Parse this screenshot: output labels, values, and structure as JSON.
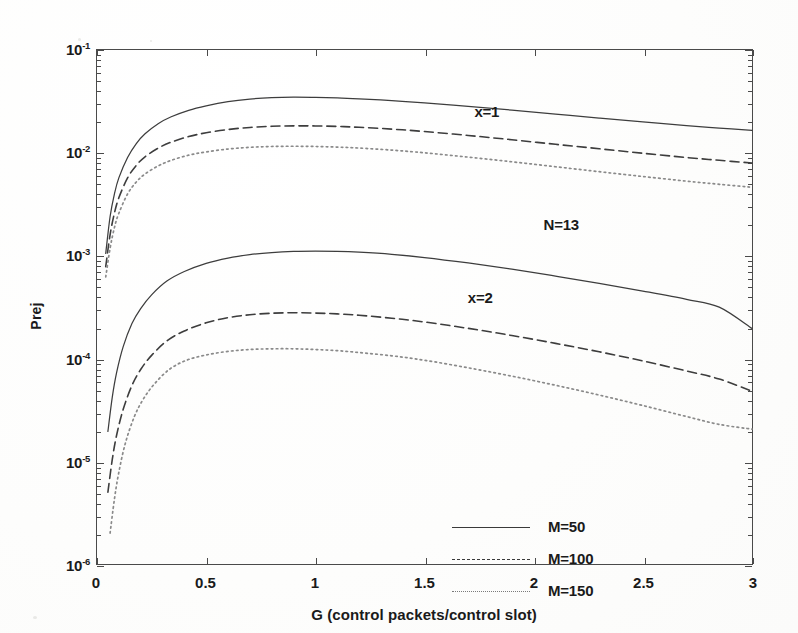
{
  "chart_data": {
    "type": "line",
    "title": "",
    "xlabel": "G (control packets/control slot)",
    "ylabel": "Prej",
    "xscale": "linear",
    "yscale": "log",
    "xlim": [
      0,
      3
    ],
    "ylim": [
      1e-06,
      0.1
    ],
    "grid": false,
    "xticks": [
      "0",
      "0.5",
      "1",
      "1.5",
      "2",
      "2.5",
      "3"
    ],
    "xtick_values": [
      0,
      0.5,
      1,
      1.5,
      2,
      2.5,
      3
    ],
    "ytick_labels": [
      "10-1",
      "10-2",
      "10-3",
      "10-4",
      "10-5",
      "10-6"
    ],
    "ytick_mantissa": [
      "10",
      "10",
      "10",
      "10",
      "10",
      "10"
    ],
    "ytick_exponent": [
      "-1",
      "-2",
      "-3",
      "-4",
      "-5",
      "-6"
    ],
    "ytick_values": [
      0.1,
      0.01,
      0.001,
      0.0001,
      1e-05,
      1e-06
    ],
    "legend_position": "bottom-center-inside",
    "legend": [
      {
        "label": "M=50",
        "style": "solid"
      },
      {
        "label": "M=100",
        "style": "dashed"
      },
      {
        "label": "M=150",
        "style": "dotted"
      }
    ],
    "annotations": [
      {
        "text": "x=1",
        "x": 1.78,
        "y": 0.0255
      },
      {
        "text": "N=13",
        "x": 2.12,
        "y": 0.00205
      },
      {
        "text": "x=2",
        "x": 1.75,
        "y": 0.0004
      }
    ],
    "series": [
      {
        "name": "x=1, M=50",
        "group": "x=1",
        "style": "solid",
        "x": [
          0.04,
          0.06,
          0.08,
          0.1,
          0.14,
          0.18,
          0.22,
          0.28,
          0.34,
          0.42,
          0.5,
          0.6,
          0.7,
          0.8,
          0.9,
          1.0,
          1.1,
          1.2,
          1.35,
          1.5,
          1.7,
          1.9,
          2.1,
          2.3,
          2.5,
          2.7,
          2.85,
          3.0
        ],
        "y": [
          0.00105,
          0.0024,
          0.004,
          0.0057,
          0.009,
          0.0123,
          0.0153,
          0.0192,
          0.0224,
          0.0259,
          0.0286,
          0.0314,
          0.0333,
          0.0344,
          0.0348,
          0.0346,
          0.0342,
          0.0335,
          0.0322,
          0.0306,
          0.0283,
          0.026,
          0.0238,
          0.0218,
          0.02,
          0.0184,
          0.0174,
          0.0165
        ]
      },
      {
        "name": "x=1, M=100",
        "group": "x=1",
        "style": "dashed",
        "x": [
          0.04,
          0.06,
          0.08,
          0.1,
          0.14,
          0.18,
          0.22,
          0.28,
          0.34,
          0.42,
          0.5,
          0.6,
          0.7,
          0.8,
          0.9,
          1.0,
          1.1,
          1.2,
          1.35,
          1.5,
          1.7,
          1.9,
          2.1,
          2.3,
          2.5,
          2.7,
          2.85,
          3.0
        ],
        "y": [
          0.00078,
          0.0016,
          0.0026,
          0.00365,
          0.0057,
          0.00755,
          0.00915,
          0.0111,
          0.0127,
          0.0144,
          0.01565,
          0.01685,
          0.01765,
          0.0181,
          0.01828,
          0.01825,
          0.01805,
          0.0177,
          0.017,
          0.0161,
          0.01475,
          0.0134,
          0.0121,
          0.01095,
          0.0099,
          0.009,
          0.00845,
          0.00795
        ]
      },
      {
        "name": "x=1, M=150",
        "group": "x=1",
        "style": "dotted",
        "x": [
          0.04,
          0.06,
          0.08,
          0.1,
          0.14,
          0.18,
          0.22,
          0.28,
          0.34,
          0.42,
          0.5,
          0.6,
          0.7,
          0.8,
          0.9,
          1.0,
          1.1,
          1.2,
          1.35,
          1.5,
          1.7,
          1.9,
          2.1,
          2.3,
          2.5,
          2.7,
          2.85,
          3.0
        ],
        "y": [
          0.00062,
          0.00118,
          0.00188,
          0.00258,
          0.00398,
          0.0052,
          0.00622,
          0.00745,
          0.00845,
          0.00948,
          0.0102,
          0.01088,
          0.0113,
          0.01152,
          0.01158,
          0.01152,
          0.01136,
          0.01112,
          0.01062,
          0.01,
          0.00908,
          0.00818,
          0.00732,
          0.00655,
          0.00588,
          0.0053,
          0.00494,
          0.00462
        ]
      },
      {
        "name": "x=2, M=50",
        "group": "x=2",
        "style": "solid",
        "x": [
          0.05,
          0.07,
          0.09,
          0.12,
          0.16,
          0.2,
          0.25,
          0.32,
          0.4,
          0.5,
          0.6,
          0.7,
          0.8,
          0.9,
          1.0,
          1.1,
          1.2,
          1.35,
          1.5,
          1.7,
          1.9,
          2.1,
          2.3,
          2.5,
          2.7,
          2.85,
          3.0
        ],
        "y": [
          1.95e-05,
          4.2e-05,
          7.3e-05,
          0.00013,
          0.000218,
          0.000305,
          0.000415,
          0.000565,
          0.0007,
          0.00084,
          0.000945,
          0.00102,
          0.00107,
          0.001098,
          0.001105,
          0.001098,
          0.001078,
          0.001028,
          0.000958,
          0.000848,
          0.000738,
          0.000632,
          0.000538,
          0.000452,
          0.000375,
          0.000315,
          0.000195
        ]
      },
      {
        "name": "x=2, M=100",
        "group": "x=2",
        "style": "dashed",
        "x": [
          0.05,
          0.07,
          0.09,
          0.12,
          0.16,
          0.2,
          0.25,
          0.32,
          0.4,
          0.5,
          0.6,
          0.7,
          0.8,
          0.9,
          1.0,
          1.1,
          1.2,
          1.35,
          1.5,
          1.7,
          1.9,
          2.1,
          2.3,
          2.5,
          2.7,
          2.85,
          3.0
        ],
        "y": [
          5e-06,
          1.04e-05,
          1.8e-05,
          3.2e-05,
          5.45e-05,
          7.8e-05,
          0.000107,
          0.000148,
          0.000185,
          0.000222,
          0.000249,
          0.000266,
          0.000275,
          0.000278,
          0.000276,
          0.000271,
          0.000263,
          0.000246,
          0.000226,
          0.000196,
          0.000167,
          0.00014,
          0.000116,
          9.45e-05,
          7.55e-05,
          6.3e-05,
          4.8e-05
        ]
      },
      {
        "name": "x=2, M=150",
        "group": "x=2",
        "style": "dotted",
        "x": [
          0.06,
          0.08,
          0.1,
          0.13,
          0.17,
          0.21,
          0.26,
          0.33,
          0.41,
          0.5,
          0.6,
          0.7,
          0.8,
          0.9,
          1.0,
          1.1,
          1.2,
          1.35,
          1.5,
          1.7,
          1.9,
          2.1,
          2.3,
          2.5,
          2.7,
          2.85,
          3.0
        ],
        "y": [
          2e-06,
          4.3e-06,
          7.8e-06,
          1.5e-05,
          2.68e-05,
          3.95e-05,
          5.55e-05,
          7.78e-05,
          9.6e-05,
          0.000108,
          0.000117,
          0.000122,
          0.000124,
          0.000124,
          0.000122,
          0.000119,
          0.000114,
          0.000106,
          9.6e-05,
          8.1e-05,
          6.72e-05,
          5.48e-05,
          4.4e-05,
          3.48e-05,
          2.72e-05,
          2.28e-05,
          2.05e-05
        ]
      }
    ]
  }
}
